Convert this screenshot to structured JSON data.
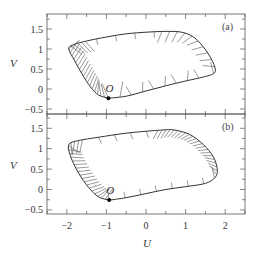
{
  "chart_data": [
    {
      "type": "line",
      "panel_label": "(a)",
      "title": "",
      "xlabel": "U",
      "ylabel": "V",
      "xlim": [
        -2.5,
        2.5
      ],
      "ylim": [
        -0.625,
        1.875
      ],
      "xticks": [
        -2,
        -1,
        0,
        1,
        2
      ],
      "yticks": [
        -0.5,
        0,
        0.5,
        1,
        1.5
      ],
      "ytick_labels": [
        "-0.5",
        "0",
        "0.5",
        "1",
        "1.5"
      ],
      "grid": false,
      "point_label": "O",
      "point": [
        -0.95,
        -0.23
      ],
      "limit_cycle": [
        [
          -0.95,
          -0.23
        ],
        [
          -0.5,
          -0.18
        ],
        [
          0,
          -0.05
        ],
        [
          0.5,
          0.08
        ],
        [
          1.0,
          0.2
        ],
        [
          1.45,
          0.3
        ],
        [
          1.7,
          0.38
        ],
        [
          1.75,
          0.5
        ],
        [
          1.65,
          0.75
        ],
        [
          1.45,
          1.05
        ],
        [
          1.2,
          1.3
        ],
        [
          0.9,
          1.42
        ],
        [
          0.5,
          1.44
        ],
        [
          0,
          1.42
        ],
        [
          -0.5,
          1.38
        ],
        [
          -1.0,
          1.3
        ],
        [
          -1.5,
          1.2
        ],
        [
          -1.85,
          1.1
        ],
        [
          -1.95,
          1.0
        ],
        [
          -1.8,
          0.7
        ],
        [
          -1.6,
          0.35
        ],
        [
          -1.4,
          0.05
        ],
        [
          -1.2,
          -0.15
        ],
        [
          -0.95,
          -0.23
        ]
      ],
      "description": "Limit cycle with short vector segments (hair-like) attached along left side and right side; dense fan near O"
    },
    {
      "type": "line",
      "panel_label": "(b)",
      "title": "",
      "xlabel": "U",
      "ylabel": "V",
      "xlim": [
        -2.5,
        2.5
      ],
      "ylim": [
        -0.6,
        1.85
      ],
      "xticks": [
        -2,
        -1,
        0,
        1,
        2
      ],
      "xtick_labels": [
        "-2",
        "-1",
        "0",
        "1",
        "2"
      ],
      "yticks": [
        -0.5,
        0,
        0.5,
        1,
        1.5
      ],
      "ytick_labels": [
        "-0.5",
        "0",
        "0.5",
        "1",
        "1.5"
      ],
      "grid": false,
      "point_label": "O",
      "point": [
        -0.93,
        -0.26
      ],
      "limit_cycle": [
        [
          -0.93,
          -0.26
        ],
        [
          -0.5,
          -0.2
        ],
        [
          0,
          -0.1
        ],
        [
          0.5,
          0.0
        ],
        [
          1.0,
          0.07
        ],
        [
          1.5,
          0.15
        ],
        [
          1.75,
          0.3
        ],
        [
          1.8,
          0.5
        ],
        [
          1.7,
          0.8
        ],
        [
          1.45,
          1.1
        ],
        [
          1.1,
          1.35
        ],
        [
          0.7,
          1.46
        ],
        [
          0.3,
          1.45
        ],
        [
          -0.5,
          1.38
        ],
        [
          -1.2,
          1.28
        ],
        [
          -1.7,
          1.2
        ],
        [
          -1.95,
          1.1
        ],
        [
          -1.9,
          0.8
        ],
        [
          -1.7,
          0.4
        ],
        [
          -1.45,
          0.05
        ],
        [
          -1.2,
          -0.18
        ],
        [
          -0.93,
          -0.26
        ]
      ],
      "description": "Limit cycle with short vector segments; dense fan along lower-left and upper-right edges"
    }
  ]
}
